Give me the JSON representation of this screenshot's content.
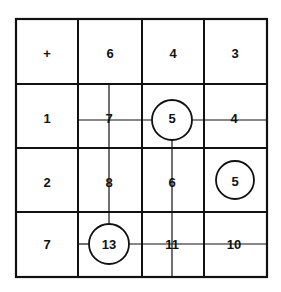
{
  "grid": {
    "rows": 4,
    "cols": 4,
    "cells": [
      [
        "+",
        "6",
        "4",
        "3"
      ],
      [
        "1",
        "7",
        "5",
        "4"
      ],
      [
        "2",
        "8",
        "6",
        "5"
      ],
      [
        "7",
        "13",
        "11",
        "10"
      ]
    ],
    "circled": [
      {
        "row": 1,
        "col": 2,
        "value": "5"
      },
      {
        "row": 2,
        "col": 3,
        "value": "5"
      },
      {
        "row": 3,
        "col": 1,
        "value": "13"
      }
    ]
  },
  "labels": {
    "r0c0": "+",
    "r0c1": "6",
    "r0c2": "4",
    "r0c3": "3",
    "r1c0": "1",
    "r1c1": "7",
    "r1c2": "5",
    "r1c3": "4",
    "r2c0": "2",
    "r2c1": "8",
    "r2c2": "6",
    "r2c3": "5",
    "r3c0": "7",
    "r3c1": "13",
    "r3c2": "11",
    "r3c3": "10"
  },
  "colors": {
    "line": "#111111",
    "background": "#ffffff"
  }
}
